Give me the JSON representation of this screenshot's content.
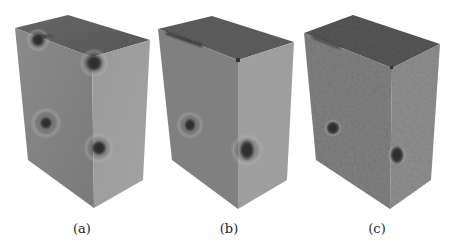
{
  "figure": {
    "panels": [
      {
        "label": "(a)",
        "description": "3D rendered box, smooth shading, four dark spherical inclusions with halos",
        "faces": {
          "top": "#5e5e5e",
          "left": "#828282",
          "right": "#9c9c9c"
        },
        "spots": [
          {
            "x": 38,
            "y": 40,
            "r": 7,
            "halo": 13
          },
          {
            "x": 94,
            "y": 63,
            "r": 9,
            "halo": 15
          },
          {
            "x": 46,
            "y": 123,
            "r": 6,
            "halo": 16
          },
          {
            "x": 99,
            "y": 148,
            "r": 8,
            "halo": 16
          }
        ]
      },
      {
        "label": "(b)",
        "description": "3D rendered box, smooth shading, two dark inclusions, crack line on top edge",
        "faces": {
          "top": "#5a5a5a",
          "left": "#808080",
          "right": "#9e9e9e"
        },
        "spots": [
          {
            "x": 190,
            "y": 125,
            "r": 6,
            "halo": 14
          },
          {
            "x": 247,
            "y": 150,
            "r": 9,
            "halo": 16
          }
        ]
      },
      {
        "label": "(c)",
        "description": "3D rendered box, noisy textured surface, two dark inclusions",
        "faces": {
          "top": "#555555",
          "left": "#7c7c7c",
          "right": "#8c8c8c"
        },
        "spots": [
          {
            "x": 333,
            "y": 128,
            "r": 7,
            "halo": 9
          },
          {
            "x": 397,
            "y": 155,
            "r": 8,
            "halo": 10
          }
        ]
      }
    ]
  }
}
